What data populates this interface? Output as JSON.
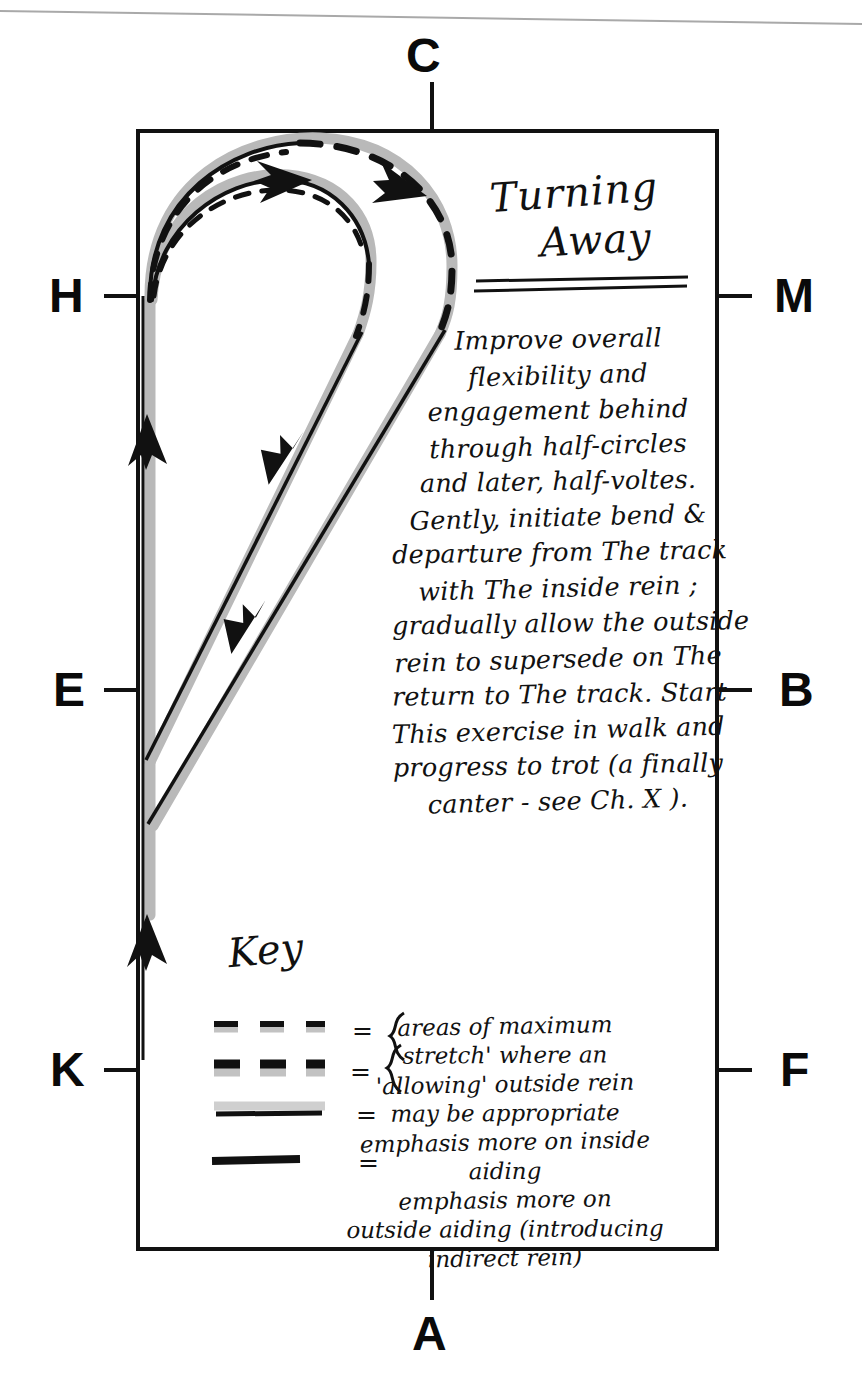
{
  "page": {
    "width": 862,
    "height": 1395,
    "background": "#ffffff",
    "ink_color": "#111111",
    "shadow_color": "#b9b9b9",
    "scan_edge_line": true
  },
  "title": {
    "line1": "Turning",
    "line2": "Away",
    "underline_count": 2
  },
  "arena": {
    "shape": "rectangle",
    "left": 138,
    "top": 131,
    "right": 717,
    "bottom": 1249,
    "stroke": "#111111",
    "stroke_width": 4,
    "markers": [
      {
        "letter": "C",
        "side": "top",
        "name": "arena-marker-c"
      },
      {
        "letter": "H",
        "side": "left",
        "name": "arena-marker-h"
      },
      {
        "letter": "M",
        "side": "right",
        "name": "arena-marker-m"
      },
      {
        "letter": "E",
        "side": "left",
        "name": "arena-marker-e"
      },
      {
        "letter": "B",
        "side": "right",
        "name": "arena-marker-b"
      },
      {
        "letter": "K",
        "side": "left",
        "name": "arena-marker-k"
      },
      {
        "letter": "F",
        "side": "right",
        "name": "arena-marker-f"
      },
      {
        "letter": "A",
        "side": "bottom",
        "name": "arena-marker-a"
      }
    ]
  },
  "body_text": {
    "lines": [
      "Improve overall",
      "flexibility and",
      "engagement behind",
      "through half-circles",
      "and later, half-voltes.",
      "Gently, initiate bend &",
      "departure from The track",
      "with The inside rein ;",
      "gradually allow the outside",
      "rein to supersede on The",
      "return to The track.  Start",
      "This exercise in walk and",
      "progress to trot (a finally",
      "canter - see Ch. X )."
    ],
    "plain": "Improve overall flexibility and engagement behind through half-circles and later, half-voltes. Gently, initiate bend & departure from The track with The inside rein; gradually allow the outside rein to supersede on The return to The track. Start This exercise in walk and progress to trot (a finally canter - see Ch. X)."
  },
  "key": {
    "heading": "Key",
    "equals_symbol": "=",
    "brace_symbol": "}",
    "entries": [
      {
        "swatch": "thin-dashed-with-gray-shadow",
        "grouped_with_next": true,
        "label_lines": [
          "areas of maximum",
          "stretch where an",
          "'allowing' outside rein",
          "may be appropriate"
        ],
        "label": "areas of maximum stretch where an 'allowing' outside rein may be appropriate"
      },
      {
        "swatch": "thick-dashed-with-gray-shadow",
        "grouped_with_next": false,
        "label_lines": [],
        "label": "areas of maximum stretch where an 'allowing' outside rein may be appropriate"
      },
      {
        "swatch": "thin-solid-with-gray-shadow",
        "grouped_with_next": false,
        "label_lines": [
          "emphasis more on inside",
          "aiding"
        ],
        "label": "emphasis more on inside aiding"
      },
      {
        "swatch": "thick-solid-black",
        "grouped_with_next": false,
        "label_lines": [
          "emphasis more on",
          "outside aiding (introducing",
          "indirect rein)"
        ],
        "label": "emphasis more on outside aiding (introducing indirect rein)"
      }
    ],
    "text_lines": [
      "areas of maximum",
      "stretch' where an",
      "'allowing' outside rein",
      "may be appropriate",
      "emphasis more on inside",
      "aiding",
      "emphasis more on",
      "outside aiding (introducing",
      "indirect rein)"
    ]
  },
  "figure": {
    "track_line_color": "#b9b9b9",
    "path_ink": "#111111",
    "arrowheads": [
      {
        "name": "arrowhead-track-upper",
        "x": 148,
        "y": 440,
        "dir": "up"
      },
      {
        "name": "arrowhead-track-lower",
        "x": 148,
        "y": 940,
        "dir": "up"
      },
      {
        "name": "arrowhead-inner-arc",
        "x": 285,
        "y": 178,
        "dir": "right"
      },
      {
        "name": "arrowhead-outer-arc",
        "x": 405,
        "y": 176,
        "dir": "right"
      },
      {
        "name": "arrowhead-diag-upper",
        "x": 297,
        "y": 452,
        "dir": "down-left"
      },
      {
        "name": "arrowhead-diag-lower",
        "x": 258,
        "y": 620,
        "dir": "down-left"
      }
    ]
  }
}
